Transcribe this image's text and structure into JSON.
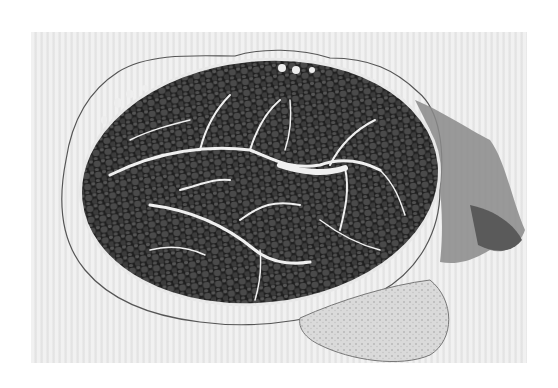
{
  "image": {
    "subject": "muscle cross-section micrograph",
    "style": "grayscale",
    "colors": {
      "background": "#e9e9e9",
      "muscle_fibers": "#3a3a3a",
      "fiber_dark": "#1e1e1e",
      "septa": "#f2f2f2",
      "connective_tissue": "#8a8a8a",
      "pale_lobe": "#d6d6d6",
      "membrane": "#555555"
    }
  }
}
